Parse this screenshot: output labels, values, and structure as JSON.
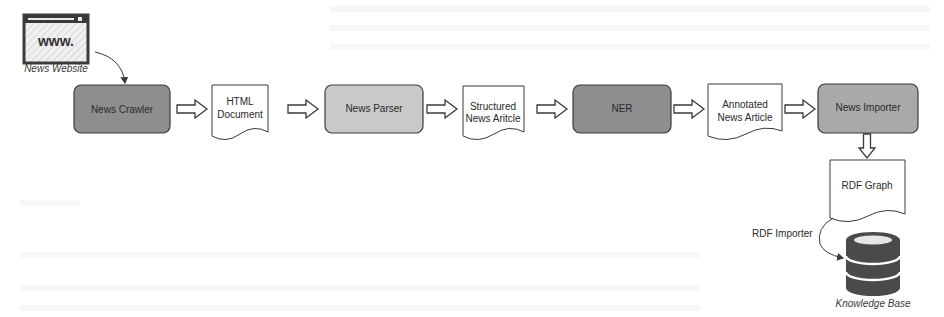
{
  "diagram": {
    "type": "pipeline-flowchart",
    "source_node": {
      "label": "News Website",
      "icon": "web-browser-icon",
      "icon_text": "www."
    },
    "process_nodes": [
      {
        "id": "crawler",
        "label": "News Crawler",
        "fill": "#8e8e8e"
      },
      {
        "id": "parser",
        "label": "News Parser",
        "fill": "#c9c9c9"
      },
      {
        "id": "ner",
        "label": "NER",
        "fill": "#8e8e8e"
      },
      {
        "id": "importer",
        "label": "News Importer",
        "fill": "#a9a9a9"
      }
    ],
    "document_nodes": [
      {
        "id": "html",
        "line1": "HTML",
        "line2": "Document"
      },
      {
        "id": "structured",
        "line1": "Structured",
        "line2": "News Aritcle"
      },
      {
        "id": "annotated",
        "line1": "Annotated",
        "line2": "News Article"
      },
      {
        "id": "rdf",
        "line1": "RDF Graph"
      }
    ],
    "store_node": {
      "label": "Knowledge Base",
      "icon": "database-icon"
    },
    "edge_labels": {
      "rdf_importer": "RDF Importer"
    },
    "edges": [
      [
        "News Website",
        "News Crawler"
      ],
      [
        "News Crawler",
        "HTML Document"
      ],
      [
        "HTML Document",
        "News Parser"
      ],
      [
        "News Parser",
        "Structured News Aritcle"
      ],
      [
        "Structured News Aritcle",
        "NER"
      ],
      [
        "NER",
        "Annotated News Article"
      ],
      [
        "Annotated News Article",
        "News Importer"
      ],
      [
        "News Importer",
        "RDF Graph"
      ],
      [
        "RDF Graph",
        "Knowledge Base"
      ]
    ],
    "colors": {
      "stroke": "#3a3a3a",
      "db_fill": "#4a4a4a",
      "background": "#ffffff"
    }
  }
}
